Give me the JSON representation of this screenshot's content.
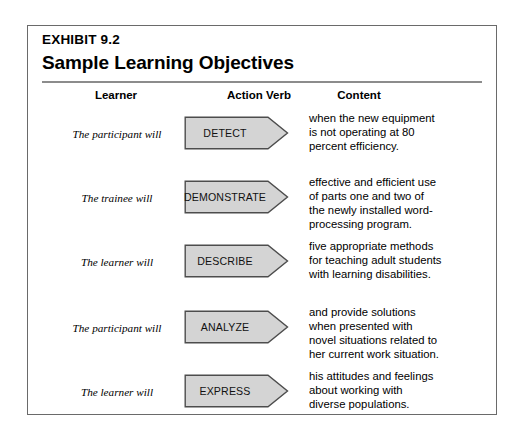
{
  "exhibit": {
    "label": "EXHIBIT 9.2",
    "title": "Sample Learning Objectives"
  },
  "colors": {
    "frame_border": "#6a6a6a",
    "rule": "#8c8c8c",
    "arrow_fill": "#d4d4d4",
    "arrow_stroke": "#4d4d4d",
    "text": "#000000"
  },
  "columns": {
    "learner": "Learner",
    "action_verb": "Action Verb",
    "content": "Content"
  },
  "rows": [
    {
      "learner": "The participant will",
      "verb": "DETECT",
      "content": "when the new equipment\nis not operating at 80\npercent efficiency."
    },
    {
      "learner": "The trainee will",
      "verb": "DEMONSTRATE",
      "content": "effective and efficient use\nof parts one and two of\nthe newly installed word-\nprocessing program."
    },
    {
      "learner": "The learner will",
      "verb": "DESCRIBE",
      "content": "five appropriate methods\nfor teaching adult students\nwith learning disabilities."
    },
    {
      "learner": "The participant will",
      "verb": "ANALYZE",
      "content": "and provide solutions\nwhen presented with\nnovel situations related to\nher current work situation."
    },
    {
      "learner": "The learner will",
      "verb": "EXPRESS",
      "content": "his attitudes and feelings\nabout working with\ndiverse populations."
    }
  ]
}
